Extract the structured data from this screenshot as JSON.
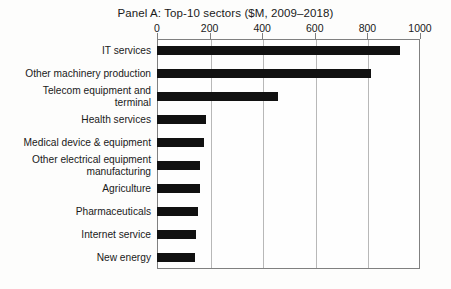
{
  "chart_data": {
    "type": "bar",
    "orientation": "horizontal",
    "title": "Panel A: Top-10 sectors ($M, 2009–2018)",
    "xlabel": "",
    "ylabel": "",
    "xlim": [
      0,
      1000
    ],
    "xticks": [
      0,
      200,
      400,
      600,
      800,
      1000
    ],
    "xtick_labels": [
      "0",
      "200",
      "400",
      "600",
      "800",
      "1000"
    ],
    "grid": true,
    "grid_axis": "x",
    "legend": false,
    "bar_color": "#111111",
    "frame_color": "#808080",
    "gridline_color": "#b8b8b8",
    "categories": [
      "IT services",
      "Other machinery production",
      "Telecom equipment and\nterminal",
      "Health services",
      "Medical device & equipment",
      "Other electrical  equipment\nmanufacturing",
      "Agriculture",
      "Pharmaceuticals",
      "Internet service",
      "New energy"
    ],
    "values": [
      925,
      815,
      460,
      185,
      180,
      165,
      163,
      155,
      148,
      145
    ],
    "units": "$M"
  }
}
